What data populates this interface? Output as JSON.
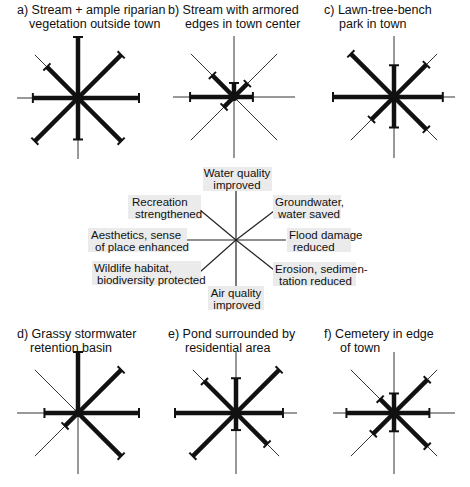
{
  "axes": [
    {
      "key": "N",
      "label": [
        "Water quality",
        "improved"
      ]
    },
    {
      "key": "NE",
      "label": [
        "Groundwater,",
        "water saved"
      ]
    },
    {
      "key": "E",
      "label": [
        "Flood damage",
        "reduced"
      ]
    },
    {
      "key": "SE",
      "label": [
        "Erosion, sedimen-",
        "tation reduced"
      ]
    },
    {
      "key": "S",
      "label": [
        "Air quality",
        "improved"
      ]
    },
    {
      "key": "SW",
      "label": [
        "Wildlife habitat,",
        "biodiversity protected"
      ]
    },
    {
      "key": "W",
      "label": [
        "Aesthetics, sense",
        "of place enhanced"
      ]
    },
    {
      "key": "NW",
      "label": [
        "Recreation",
        "strengthened"
      ]
    }
  ],
  "legend": {
    "center": [
      236,
      240
    ],
    "label_box_color": "#ebebeb"
  },
  "panels": [
    {
      "id": "a",
      "title": [
        "a) Stream + ample riparian",
        "vegetation outside town"
      ],
      "center": [
        78,
        98
      ],
      "values": {
        "N": 1.0,
        "NE": 1.0,
        "E": 1.0,
        "SE": 1.0,
        "S": 0.68,
        "SW": 1.0,
        "W": 0.74,
        "NW": 0.72
      }
    },
    {
      "id": "b",
      "title": [
        "b) Stream with armored",
        "edges in town center"
      ],
      "center": [
        234,
        97
      ],
      "values": {
        "N": 0.23,
        "NE": 0.31,
        "E": 0.31,
        "SE": 0,
        "S": 0,
        "SW": 0.23,
        "W": 0.72,
        "NW": 0.5
      }
    },
    {
      "id": "c",
      "title": [
        "c) Lawn-tree-bench",
        "park in town"
      ],
      "center": [
        394,
        97
      ],
      "values": {
        "N": 0.52,
        "NE": 0.75,
        "E": 0.8,
        "SE": 0.75,
        "S": 0.5,
        "SW": 0.52,
        "W": 1.0,
        "NW": 1.0
      }
    },
    {
      "id": "d",
      "title": [
        "d) Grassy stormwater",
        "retention basin"
      ],
      "center": [
        78,
        413
      ],
      "values": {
        "N": 1.0,
        "NE": 1.0,
        "E": 1.0,
        "SE": 1.0,
        "S": 0,
        "SW": 0.3,
        "W": 0.55,
        "NW": 0
      }
    },
    {
      "id": "e",
      "title": [
        "e) Pond surrounded by",
        "residential area"
      ],
      "center": [
        236,
        413
      ],
      "values": {
        "N": 0.57,
        "NE": 1.0,
        "E": 0.77,
        "SE": 0.72,
        "S": 0.28,
        "SW": 1.0,
        "W": 1.0,
        "NW": 0.73
      }
    },
    {
      "id": "f",
      "title": [
        "f) Cemetery in edge",
        "of town"
      ],
      "center": [
        394,
        413
      ],
      "values": {
        "N": 0.32,
        "NE": 0.77,
        "E": 0.58,
        "SE": 0.77,
        "S": 0.3,
        "SW": 0.48,
        "W": 0.78,
        "NW": 0.32
      }
    }
  ],
  "style": {
    "axis_radius": 61,
    "thin_color": "#333333",
    "bar_color": "#111111"
  }
}
